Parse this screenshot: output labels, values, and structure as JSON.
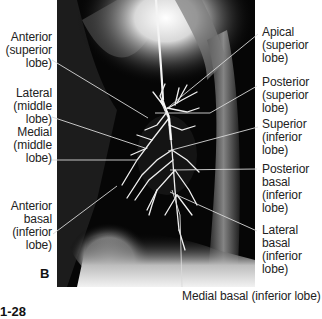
{
  "figure": {
    "panel_letter": "B",
    "figure_number_partial": "1-28",
    "labels_left": [
      {
        "id": "anterior-superior",
        "lines": [
          "Anterior",
          "(superior",
          "lobe)"
        ]
      },
      {
        "id": "lateral-middle",
        "lines": [
          "Lateral",
          "(middle",
          "lobe)"
        ]
      },
      {
        "id": "medial-middle",
        "lines": [
          "Medial",
          "(middle",
          "lobe)"
        ]
      },
      {
        "id": "anterior-basal-inferior",
        "lines": [
          "Anterior",
          "basal",
          "(inferior",
          "lobe)"
        ]
      }
    ],
    "labels_right": [
      {
        "id": "apical-superior",
        "lines": [
          "Apical",
          "(superior",
          "lobe)"
        ]
      },
      {
        "id": "posterior-superior",
        "lines": [
          "Posterior",
          "(superior",
          "lobe)"
        ]
      },
      {
        "id": "superior-inferior",
        "lines": [
          "Superior",
          "(inferior",
          "lobe)"
        ]
      },
      {
        "id": "posterior-basal-inferior",
        "lines": [
          "Posterior",
          "basal",
          "(inferior",
          "lobe)"
        ]
      },
      {
        "id": "lateral-basal-inferior",
        "lines": [
          "Lateral",
          "basal",
          "(inferior",
          "lobe)"
        ]
      }
    ],
    "label_bottom": {
      "id": "medial-basal-inferior",
      "text": "Medial basal (inferior lobe)"
    },
    "colors": {
      "background": "#ffffff",
      "xray_dark": "#050505",
      "xray_light": "#e8e8e8",
      "leader_line": "#cfcfcf",
      "text": "#222222"
    }
  }
}
